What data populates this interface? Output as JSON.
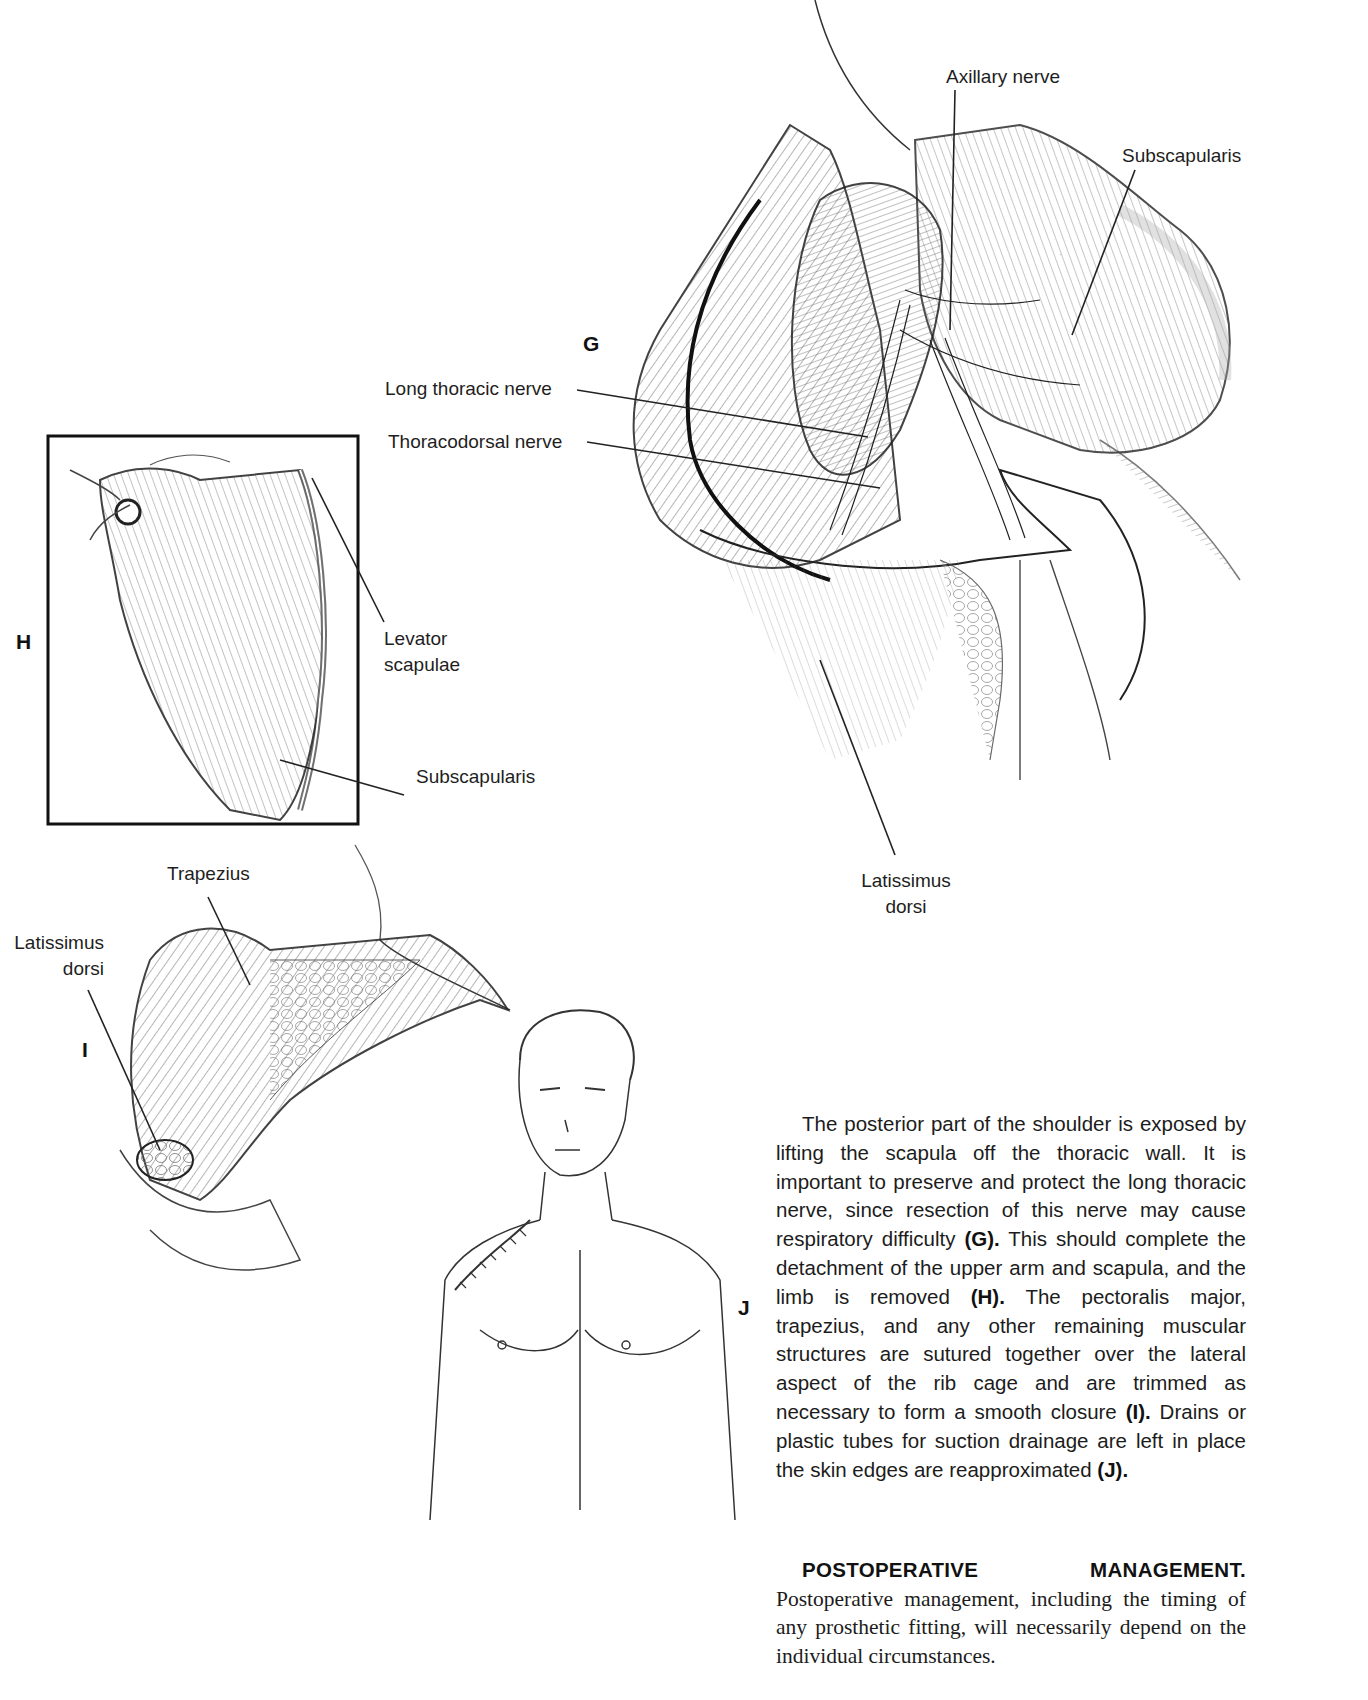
{
  "figures": {
    "G": {
      "letter": "G",
      "labels": {
        "axillary_nerve": "Axillary nerve",
        "subscapularis": "Subscapularis",
        "long_thoracic_nerve": "Long thoracic nerve",
        "thoracodorsal_nerve": "Thoracodorsal nerve",
        "latissimus_line1": "Latissimus",
        "latissimus_line2": "dorsi"
      }
    },
    "H": {
      "letter": "H",
      "labels": {
        "levator_line1": "Levator",
        "levator_line2": "scapulae",
        "subscapularis": "Subscapularis"
      }
    },
    "I": {
      "letter": "I",
      "labels": {
        "trapezius": "Trapezius",
        "latissimus_line1": "Latissimus",
        "latissimus_line2": "dorsi"
      }
    },
    "J": {
      "letter": "J"
    }
  },
  "body_text": {
    "p1_a": "The posterior part of the shoulder is exposed by lifting the scapula off the thoracic wall. It is important to preserve and protect the long thoracic nerve, since resection of this nerve may cause respiratory difficulty ",
    "ref_g": "(G).",
    "p1_b": " This should complete the detachment of the upper arm and scapula, and the limb is removed ",
    "ref_h": "(H).",
    "p1_c": " The pectoralis major, trapezius, and any other remaining muscular structures are sutured together over the lateral aspect of the rib cage and are trimmed as necessary to form a smooth closure ",
    "ref_i": "(I).",
    "p1_d": " Drains or plastic tubes for suction drainage are left in place the skin edges are reapproximated ",
    "ref_j": "(J).",
    "postop_heading": "POSTOPERATIVE MANAGEMENT.",
    "postop_text": " Postoperative management, including the timing of any prosthetic fitting, will necessarily depend on the individual circumstances."
  }
}
